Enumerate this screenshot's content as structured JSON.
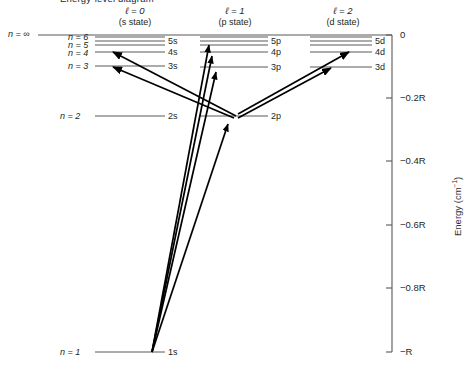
{
  "figure": {
    "title_partial": "Energy-level diagram",
    "axis_title": "Energy (cm",
    "axis_title_exp": "−1",
    "axis_title_tail": ")",
    "infinity_label": "n = ∞"
  },
  "columns": [
    {
      "name": "s-column",
      "header": "ℓ = 0",
      "subheader": "(s state)"
    },
    {
      "name": "p-column",
      "header": "ℓ = 1",
      "subheader": "(p state)"
    },
    {
      "name": "d-column",
      "header": "ℓ = 2",
      "subheader": "(d state)"
    }
  ],
  "n_labels": [
    {
      "text": "n = 6",
      "y": 37
    },
    {
      "text": "n = 5",
      "y": 44
    },
    {
      "text": "n = 4",
      "y": 52
    },
    {
      "text": "n = 3",
      "y": 66
    },
    {
      "text": "n = 2",
      "y": 116
    },
    {
      "text": "n = 1",
      "y": 352
    }
  ],
  "levels": {
    "s": [
      {
        "label": "6s",
        "n": 6,
        "energy": -0.028,
        "y": 37,
        "show_label": false
      },
      {
        "label": "5s",
        "n": 5,
        "energy": -0.04,
        "y": 41,
        "show_label": true
      },
      {
        "label": "4s",
        "n": 4,
        "energy": -0.0625,
        "y": 52,
        "show_label": true
      },
      {
        "label": "3s",
        "n": 3,
        "energy": -0.111,
        "y": 66,
        "show_label": true
      },
      {
        "label": "2s",
        "n": 2,
        "energy": -0.25,
        "y": 116,
        "show_label": true
      },
      {
        "label": "1s",
        "n": 1,
        "energy": -1.0,
        "y": 352,
        "show_label": true
      }
    ],
    "p": [
      {
        "label": "6p",
        "n": 6,
        "energy": -0.028,
        "y": 37,
        "show_label": false
      },
      {
        "label": "5p",
        "n": 5,
        "energy": -0.04,
        "y": 41,
        "show_label": true
      },
      {
        "label": "4p",
        "n": 4,
        "energy": -0.0625,
        "y": 52,
        "show_label": true
      },
      {
        "label": "3p",
        "n": 3,
        "energy": -0.111,
        "y": 67,
        "show_label": true
      },
      {
        "label": "2p",
        "n": 2,
        "energy": -0.25,
        "y": 116,
        "show_label": true
      }
    ],
    "d": [
      {
        "label": "6d",
        "n": 6,
        "energy": -0.028,
        "y": 37,
        "show_label": false
      },
      {
        "label": "5d",
        "n": 5,
        "energy": -0.04,
        "y": 41,
        "show_label": true
      },
      {
        "label": "4d",
        "n": 4,
        "energy": -0.0625,
        "y": 52,
        "show_label": true
      },
      {
        "label": "3d",
        "n": 3,
        "energy": -0.111,
        "y": 67,
        "show_label": true
      }
    ]
  },
  "axis_ticks": [
    {
      "label": "0",
      "value": 0,
      "y": 35
    },
    {
      "label": "−0.2R",
      "value": -0.2,
      "y": 98
    },
    {
      "label": "−0.4R",
      "value": -0.4,
      "y": 161
    },
    {
      "label": "−0.6R",
      "value": -0.6,
      "y": 225
    },
    {
      "label": "−0.8R",
      "value": -0.8,
      "y": 288
    },
    {
      "label": "−R",
      "value": -1.0,
      "y": 352
    }
  ],
  "transitions": [
    {
      "name": "2p-to-4s",
      "from": "2p",
      "to": "4s",
      "x1": 236,
      "y1": 116,
      "x2": 112,
      "y2": 52
    },
    {
      "name": "2p-to-3s",
      "from": "2p",
      "to": "3s",
      "x1": 236,
      "y1": 116,
      "x2": 112,
      "y2": 66
    },
    {
      "name": "2p-to-4d",
      "from": "2p",
      "to": "4d",
      "x1": 236,
      "y1": 116,
      "x2": 348,
      "y2": 52
    },
    {
      "name": "2p-to-3d",
      "from": "2p",
      "to": "3d",
      "x1": 236,
      "y1": 116,
      "x2": 330,
      "y2": 67
    },
    {
      "name": "1s-to-2p",
      "from": "1s",
      "to": "2p",
      "x1": 152,
      "y1": 352,
      "x2": 228,
      "y2": 122
    },
    {
      "name": "1s-to-3p",
      "from": "1s",
      "to": "3p",
      "x1": 152,
      "y1": 352,
      "x2": 216,
      "y2": 70
    },
    {
      "name": "1s-to-4p",
      "from": "1s",
      "to": "4p",
      "x1": 152,
      "y1": 352,
      "x2": 212,
      "y2": 54
    },
    {
      "name": "1s-to-5p",
      "from": "1s",
      "to": "5p",
      "x1": 152,
      "y1": 352,
      "x2": 209,
      "y2": 43
    }
  ],
  "colors": {
    "line": "#58585b",
    "arrow": "#000000",
    "text": "#231f20",
    "axis": "#58585b"
  }
}
